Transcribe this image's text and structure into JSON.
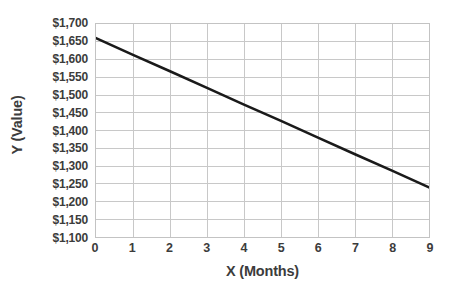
{
  "chart_data": {
    "type": "line",
    "title": "",
    "xlabel": "X (Months)",
    "ylabel": "Y (Value)",
    "x": [
      0,
      1,
      2,
      3,
      4,
      5,
      6,
      7,
      8,
      9
    ],
    "series": [
      {
        "name": "Value",
        "values": [
          1660,
          1613,
          1567,
          1520,
          1473,
          1427,
          1380,
          1333,
          1287,
          1240
        ],
        "color": "#1a1a1a"
      }
    ],
    "xlim": [
      0,
      9
    ],
    "ylim": [
      1100,
      1700
    ],
    "y_tick_values": [
      1700,
      1650,
      1600,
      1550,
      1500,
      1450,
      1400,
      1350,
      1300,
      1250,
      1200,
      1150,
      1100
    ],
    "y_tick_labels": [
      "$1,700",
      "$1,650",
      "$1,600",
      "$1,550",
      "$1,500",
      "$1,450",
      "$1,400",
      "$1,350",
      "$1,300",
      "$1,250",
      "$1,200",
      "$1,150",
      "$1,100"
    ],
    "x_tick_values": [
      0,
      1,
      2,
      3,
      4,
      5,
      6,
      7,
      8,
      9
    ],
    "x_tick_labels": [
      "0",
      "1",
      "2",
      "3",
      "4",
      "5",
      "6",
      "7",
      "8",
      "9"
    ],
    "grid": true,
    "grid_color": "#c8c8c8",
    "axis_color": "#c3c3c3",
    "label_color": "#3c3c3c",
    "legend": null,
    "legend_position": "none",
    "annotations": []
  }
}
